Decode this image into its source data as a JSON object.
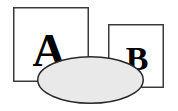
{
  "canvas": {
    "width": 178,
    "height": 111,
    "background_color": "#ffffff"
  },
  "shapes": {
    "square_a": {
      "name": "Square A",
      "label": "A",
      "x": 13,
      "y": 7,
      "width": 76,
      "height": 75,
      "fill_color": "#ffffff",
      "stroke_color": "#3a3a3a",
      "stroke_width": 1.5
    },
    "square_b": {
      "name": "Square B",
      "label": "B",
      "x": 108,
      "y": 24,
      "width": 56,
      "height": 64,
      "fill_color": "#ffffff",
      "stroke_color": "#3a3a3a",
      "stroke_width": 1.5
    },
    "ellipse": {
      "name": "Ellipse",
      "label": "",
      "center_x": 90.5,
      "center_y": 80,
      "radius_x": 53.5,
      "radius_y": 24,
      "fill_color": "#e9e9e9",
      "stroke_color": "#2a2a2a",
      "stroke_width": 1.5
    }
  },
  "labels": {
    "a": {
      "text": "A",
      "x": 49,
      "y": 66,
      "font_size": 46,
      "color": "#000000"
    },
    "b": {
      "text": "B",
      "x": 137,
      "y": 70,
      "font_size": 34,
      "color": "#000000"
    }
  }
}
